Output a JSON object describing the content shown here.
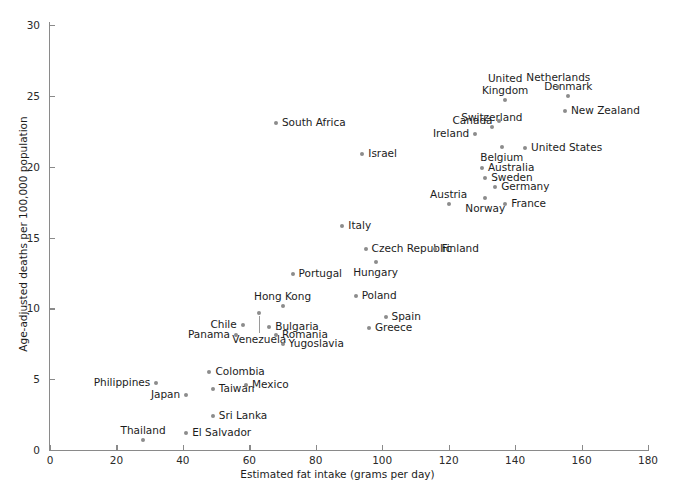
{
  "chart_data": {
    "type": "scatter",
    "title": "",
    "xlabel": "Estimated fat intake (grams per day)",
    "ylabel": "Age-adjusted deaths per 100,000 population",
    "xlim": [
      0,
      180
    ],
    "ylim": [
      0,
      30
    ],
    "xticks": [
      0,
      20,
      40,
      60,
      80,
      100,
      120,
      140,
      160,
      180
    ],
    "yticks": [
      0,
      5,
      10,
      15,
      20,
      25,
      30
    ],
    "grid": false,
    "legend": "none",
    "point_color": "#8c8c8c",
    "points": [
      {
        "label": "Thailand",
        "x": 28,
        "y": 0.7,
        "pos": "above"
      },
      {
        "label": "El Salvador",
        "x": 41,
        "y": 1.2,
        "pos": "right"
      },
      {
        "label": "Sri Lanka",
        "x": 49,
        "y": 2.4,
        "pos": "right"
      },
      {
        "label": "Philippines",
        "x": 32,
        "y": 4.7,
        "pos": "left"
      },
      {
        "label": "Japan",
        "x": 41,
        "y": 3.9,
        "pos": "left"
      },
      {
        "label": "Taiwan",
        "x": 49,
        "y": 4.3,
        "pos": "right"
      },
      {
        "label": "Colombia",
        "x": 48,
        "y": 5.5,
        "pos": "right"
      },
      {
        "label": "Mexico",
        "x": 59,
        "y": 4.6,
        "pos": "right"
      },
      {
        "label": "Venezuela",
        "x": 63,
        "y": 9.7,
        "pos": "leader-below"
      },
      {
        "label": "Panama",
        "x": 56,
        "y": 8.1,
        "pos": "left"
      },
      {
        "label": "Chile",
        "x": 58,
        "y": 8.8,
        "pos": "left"
      },
      {
        "label": "Bulgaria",
        "x": 66,
        "y": 8.7,
        "pos": "right"
      },
      {
        "label": "Romania",
        "x": 68,
        "y": 8.1,
        "pos": "right"
      },
      {
        "label": "Yugoslavia",
        "x": 70,
        "y": 7.5,
        "pos": "right"
      },
      {
        "label": "Hong Kong",
        "x": 70,
        "y": 10.2,
        "pos": "above"
      },
      {
        "label": "Portugal",
        "x": 73,
        "y": 12.4,
        "pos": "right"
      },
      {
        "label": "Greece",
        "x": 96,
        "y": 8.6,
        "pos": "right"
      },
      {
        "label": "Spain",
        "x": 101,
        "y": 9.4,
        "pos": "right"
      },
      {
        "label": "Poland",
        "x": 92,
        "y": 10.9,
        "pos": "right"
      },
      {
        "label": "Hungary",
        "x": 98,
        "y": 13.3,
        "pos": "below"
      },
      {
        "label": "Czech Republic",
        "x": 95,
        "y": 14.2,
        "pos": "right"
      },
      {
        "label": "Italy",
        "x": 88,
        "y": 15.8,
        "pos": "right"
      },
      {
        "label": "Finland",
        "x": 116,
        "y": 14.2,
        "pos": "right"
      },
      {
        "label": "Israel",
        "x": 94,
        "y": 20.9,
        "pos": "right"
      },
      {
        "label": "South Africa",
        "x": 68,
        "y": 23.1,
        "pos": "right"
      },
      {
        "label": "Austria",
        "x": 120,
        "y": 17.4,
        "pos": "above"
      },
      {
        "label": "Norway",
        "x": 131,
        "y": 17.8,
        "pos": "below"
      },
      {
        "label": "France",
        "x": 137,
        "y": 17.4,
        "pos": "right"
      },
      {
        "label": "Germany",
        "x": 134,
        "y": 18.6,
        "pos": "right"
      },
      {
        "label": "Sweden",
        "x": 131,
        "y": 19.2,
        "pos": "right"
      },
      {
        "label": "Australia",
        "x": 130,
        "y": 19.9,
        "pos": "right"
      },
      {
        "label": "United States",
        "x": 143,
        "y": 21.3,
        "pos": "right"
      },
      {
        "label": "Belgium",
        "x": 136,
        "y": 21.4,
        "pos": "below"
      },
      {
        "label": "Ireland",
        "x": 128,
        "y": 22.3,
        "pos": "left"
      },
      {
        "label": "Switzerland",
        "x": 133,
        "y": 22.8,
        "pos": "above"
      },
      {
        "label": "Canada",
        "x": 135,
        "y": 23.2,
        "pos": "left"
      },
      {
        "label": "New Zealand",
        "x": 155,
        "y": 23.9,
        "pos": "right"
      },
      {
        "label": "Denmark",
        "x": 156,
        "y": 25.0,
        "pos": "above"
      },
      {
        "label": "United Kingdom",
        "x": 137,
        "y": 24.7,
        "pos": "above-two-line"
      },
      {
        "label": "Netherlands",
        "x": 153,
        "y": 25.6,
        "pos": "above"
      }
    ]
  }
}
